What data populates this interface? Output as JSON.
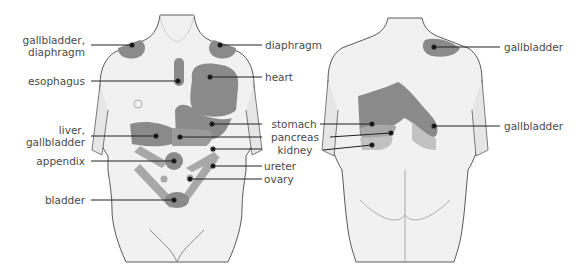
{
  "diagram": {
    "type": "referred-pain-map",
    "colors": {
      "skin": "#f1f1f1",
      "skin_shade": "#d9d9d9",
      "outline": "#5a5a5a",
      "pain_dark": "#8a8a8a",
      "pain_mid": "#a8a8a8",
      "pain_light": "#c2c2c2",
      "leader": "#222222",
      "text": "#4a4a4a"
    },
    "front_view": {
      "labels": [
        {
          "id": "gallbladder-diaphragm",
          "text_lines": [
            "gallbladder,",
            "diaphragm"
          ]
        },
        {
          "id": "esophagus",
          "text_lines": [
            "esophagus"
          ]
        },
        {
          "id": "liver-gallbladder",
          "text_lines": [
            "liver,",
            "gallbladder"
          ]
        },
        {
          "id": "appendix",
          "text_lines": [
            "appendix"
          ]
        },
        {
          "id": "bladder",
          "text_lines": [
            "bladder"
          ]
        },
        {
          "id": "diaphragm",
          "text_lines": [
            "diaphragm"
          ]
        },
        {
          "id": "heart",
          "text_lines": [
            "heart"
          ]
        },
        {
          "id": "stomach",
          "text_lines": [
            "stomach"
          ]
        },
        {
          "id": "pancreas",
          "text_lines": [
            "pancreas"
          ]
        },
        {
          "id": "kidney",
          "text_lines": [
            "kidney"
          ]
        },
        {
          "id": "ureter",
          "text_lines": [
            "ureter"
          ]
        },
        {
          "id": "ovary",
          "text_lines": [
            "ovary"
          ]
        }
      ]
    },
    "back_view": {
      "labels": [
        {
          "id": "gallbladder-shoulder",
          "text_lines": [
            "gallbladder"
          ]
        },
        {
          "id": "gallbladder-back",
          "text_lines": [
            "gallbladder"
          ]
        }
      ]
    }
  }
}
